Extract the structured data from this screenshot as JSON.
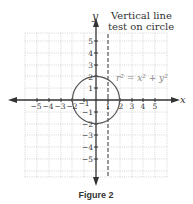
{
  "figure": {
    "caption": "Figure 2",
    "annotation_line1": "Vertical line",
    "annotation_line2": "test on circle",
    "equation": "r² = x² + y²",
    "x_axis_label": "x",
    "y_axis_label": "y",
    "x_ticks": [
      "−5",
      "−4",
      "−3",
      "−2",
      "−1",
      "1",
      "2",
      "3",
      "4",
      "5"
    ],
    "y_ticks": [
      "5",
      "4",
      "3",
      "2",
      "1",
      "−1",
      "−2",
      "−3",
      "−4",
      "−5"
    ],
    "circle_radius": 2,
    "vertical_line_x": 1,
    "colors": {
      "axis": "#333333",
      "grid": "#bbbbbb",
      "circle": "#555555",
      "text": "#333333"
    }
  }
}
